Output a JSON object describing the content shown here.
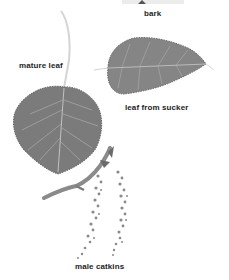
{
  "plate": {
    "labels": {
      "bark": "bark",
      "mature_leaf": "mature leaf",
      "leaf_from_sucker": "leaf from sucker",
      "male_catkins": "male catkins"
    },
    "colors": {
      "background": "#ffffff",
      "leaf_fill": "#7d7d7d",
      "leaf_dark": "#5e5e5e",
      "vein": "#c8c8c8",
      "stalk": "#d4d4d4",
      "catkin": "#8a8a8a",
      "label_text": "#1e1e1e"
    }
  }
}
